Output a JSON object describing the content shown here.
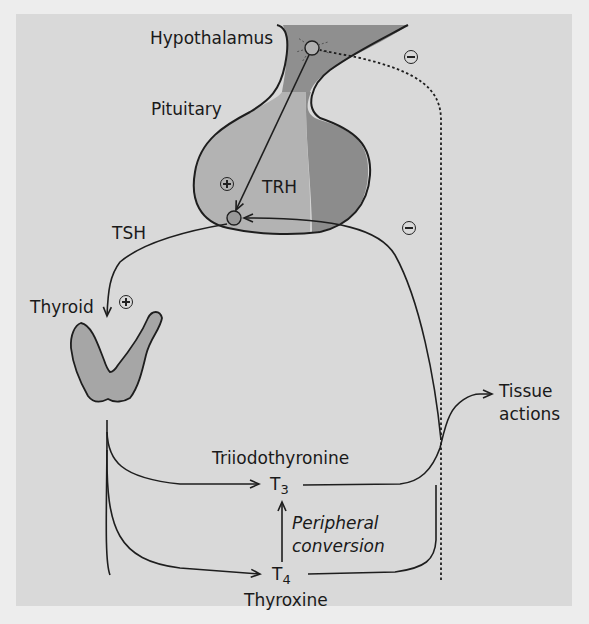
{
  "labels": {
    "hypothalamus": "Hypothalamus",
    "pituitary": "Pituitary",
    "trh": "TRH",
    "tsh": "TSH",
    "thyroid": "Thyroid",
    "tissue_actions_line1": "Tissue",
    "tissue_actions_line2": "actions",
    "triiodothyronine": "Triiodothyronine",
    "t3_base": "T",
    "t3_sub": "3",
    "peripheral_line1": "Peripheral",
    "peripheral_line2": "conversion",
    "t4_base": "T",
    "t4_sub": "4",
    "thyroxine": "Thyroxine"
  },
  "symbols": {
    "trh_effect": "plus",
    "tsh_effect": "plus",
    "feedback_pituitary": "minus",
    "feedback_hypothalamus": "minus"
  },
  "colors": {
    "background": "#d9d9d9",
    "page": "#ededed",
    "hypothalamus_fill": "#8f8f8f",
    "pituitary_anterior_fill": "#b3b3b3",
    "pituitary_posterior_fill": "#8c8c8c",
    "thyroid_fill": "#a6a6a6",
    "line": "#1e1e1e"
  }
}
